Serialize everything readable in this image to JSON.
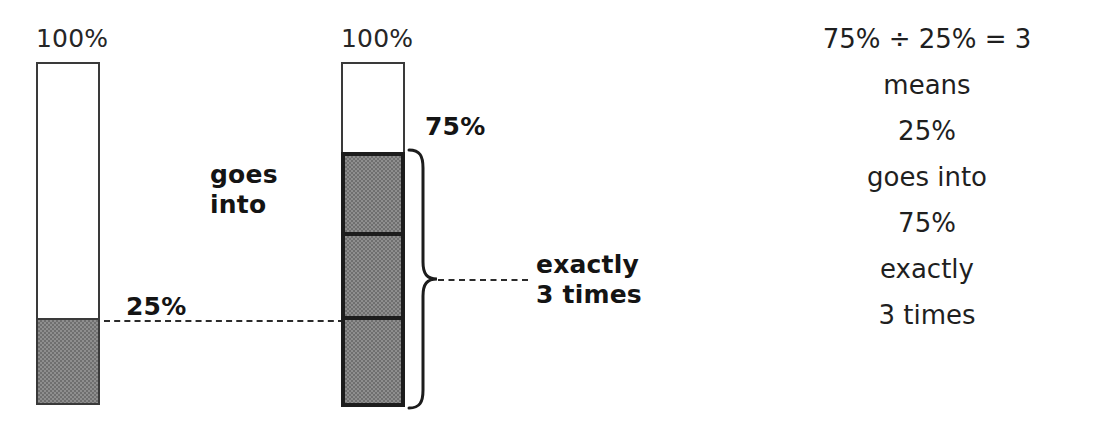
{
  "diagram": {
    "left_bar": {
      "top_label": "100%",
      "fill_label": "25%",
      "fill_percent": 25,
      "total_percent": 100
    },
    "right_bar": {
      "top_label": "100%",
      "fill_label": "75%",
      "fill_percent": 75,
      "total_percent": 100,
      "segments": 3
    },
    "middle_caption": {
      "line1": "goes",
      "line2": "into"
    },
    "brace_caption": {
      "line1": "exactly",
      "line2": "3 times"
    }
  },
  "explanation": {
    "lines": [
      "75% ÷ 25% = 3",
      "means",
      "25%",
      "goes into",
      "75%",
      "exactly",
      "3 times"
    ]
  },
  "colors": {
    "ink": "#1a1a1a",
    "outline_thin": "#3a3a3a",
    "outline_thick": "#1c1c1c",
    "shade_gray": "#8e8e8e",
    "background": "#ffffff"
  }
}
